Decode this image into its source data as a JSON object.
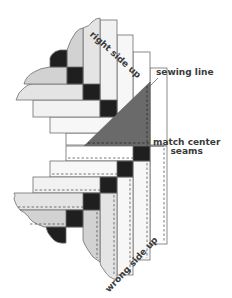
{
  "diagram": {
    "labels": {
      "right_side_up": "right side up",
      "sewing_line": "sewing line",
      "match_center_line1": "match center",
      "match_center_line2": "seams",
      "wrong_side_up": "wrong side up"
    },
    "colors": {
      "black_square": "#1f1f1f",
      "light_strip": "#e2e2e2",
      "white_strip": "#f7f7f7",
      "mid_strip": "#cfcfcf",
      "triangle": "#6a6a6a",
      "outline": "#6e6e6e",
      "label_text": "#3a3a3a"
    }
  }
}
